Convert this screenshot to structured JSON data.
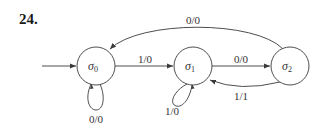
{
  "problem": {
    "number": "24."
  },
  "diagram": {
    "type": "finite-state-machine",
    "states": [
      {
        "id": "s0",
        "name": "σ",
        "subscript": "0",
        "initial": true
      },
      {
        "id": "s1",
        "name": "σ",
        "subscript": "1",
        "initial": false
      },
      {
        "id": "s2",
        "name": "σ",
        "subscript": "2",
        "initial": false
      }
    ],
    "transitions": [
      {
        "from": "s0",
        "to": "s0",
        "label": "0/0"
      },
      {
        "from": "s0",
        "to": "s1",
        "label": "1/0"
      },
      {
        "from": "s1",
        "to": "s1",
        "label": "1/0"
      },
      {
        "from": "s1",
        "to": "s2",
        "label": "0/0"
      },
      {
        "from": "s2",
        "to": "s1",
        "label": "1/1"
      },
      {
        "from": "s2",
        "to": "s0",
        "label": "0/0"
      }
    ],
    "colors": {
      "stroke": "#3a3a3a",
      "text": "#333333",
      "background": "#ffffff"
    }
  }
}
